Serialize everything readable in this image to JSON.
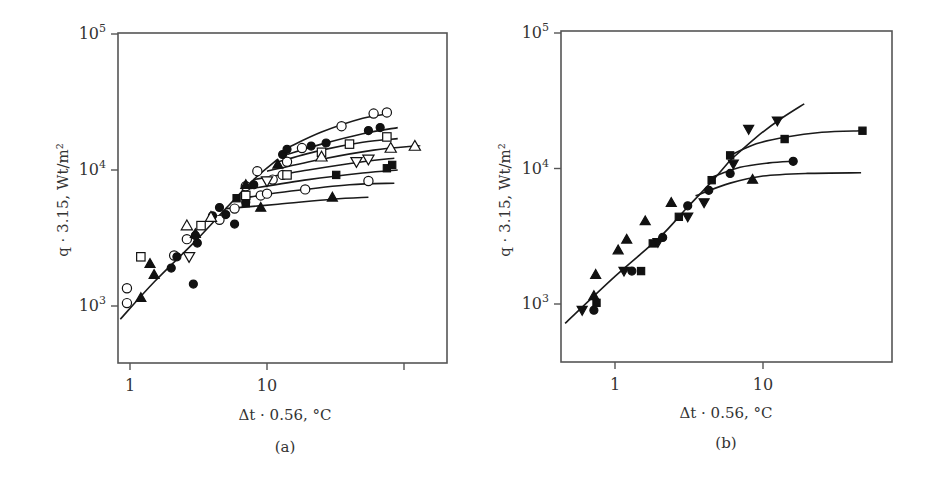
{
  "chart_data": [
    {
      "type": "scatter",
      "panel_label": "(a)",
      "xlabel": "Δt · 0.56, °C",
      "ylabel": "q · 3.15, Wt/m²",
      "xscale": "log",
      "yscale": "log",
      "xlim": [
        0.85,
        230
      ],
      "ylim": [
        450,
        100000
      ],
      "xticks": [
        {
          "v": 1,
          "label": "1"
        },
        {
          "v": 10,
          "label": "10"
        },
        {
          "v": 100,
          "label": ""
        }
      ],
      "yticks": [
        {
          "v": 1000,
          "label": "10",
          "sup": "3"
        },
        {
          "v": 10000,
          "label": "10",
          "sup": "4"
        },
        {
          "v": 100000,
          "label": "10",
          "sup": "5"
        }
      ],
      "grid": false,
      "lines": [
        {
          "name": "common",
          "points": [
            [
              0.85,
              800
            ],
            [
              1.5,
              1500
            ],
            [
              3,
              3000
            ],
            [
              5,
              5200
            ],
            [
              8,
              8500
            ],
            [
              12,
              12000
            ]
          ]
        },
        {
          "name": "open-circle-small",
          "points": [
            [
              14,
              14500
            ],
            [
              25,
              19000
            ],
            [
              50,
              24000
            ],
            [
              80,
              26000
            ]
          ]
        },
        {
          "name": "filled-circle",
          "points": [
            [
              14,
              13000
            ],
            [
              25,
              15500
            ],
            [
              50,
              18500
            ],
            [
              90,
              20500
            ]
          ]
        },
        {
          "name": "open-square",
          "points": [
            [
              12,
              11500
            ],
            [
              25,
              14000
            ],
            [
              50,
              16000
            ],
            [
              90,
              17000
            ]
          ]
        },
        {
          "name": "open-triangle",
          "points": [
            [
              10,
              9800
            ],
            [
              25,
              12000
            ],
            [
              60,
              14000
            ],
            [
              120,
              15000
            ],
            [
              130,
              15000
            ]
          ]
        },
        {
          "name": "open-triangle-down",
          "points": [
            [
              8,
              8500
            ],
            [
              20,
              10000
            ],
            [
              50,
              11500
            ],
            [
              85,
              12200
            ]
          ]
        },
        {
          "name": "filled-square",
          "points": [
            [
              7,
              7200
            ],
            [
              20,
              8500
            ],
            [
              50,
              9500
            ],
            [
              90,
              10000
            ]
          ]
        },
        {
          "name": "open-circle-large",
          "points": [
            [
              6.5,
              6200
            ],
            [
              15,
              7000
            ],
            [
              40,
              7800
            ],
            [
              85,
              8000
            ]
          ]
        },
        {
          "name": "filled-triangle",
          "points": [
            [
              5,
              5200
            ],
            [
              12,
              5600
            ],
            [
              30,
              6100
            ],
            [
              55,
              6300
            ]
          ]
        }
      ],
      "series": [
        {
          "name": "open-circle",
          "marker": "circle",
          "filled": false,
          "points": [
            [
              0.95,
              1350
            ],
            [
              0.95,
              1050
            ],
            [
              2.1,
              2350
            ],
            [
              2.6,
              3100
            ],
            [
              4.5,
              4300
            ],
            [
              5.8,
              5200
            ],
            [
              7,
              7600
            ],
            [
              8.5,
              9800
            ],
            [
              9,
              6500
            ],
            [
              10,
              6700
            ],
            [
              11,
              8500
            ],
            [
              13,
              9200
            ],
            [
              14,
              11500
            ],
            [
              18,
              14500
            ],
            [
              19,
              7200
            ],
            [
              35,
              21000
            ],
            [
              60,
              26000
            ],
            [
              75,
              26500
            ],
            [
              55,
              8300
            ]
          ]
        },
        {
          "name": "filled-circle",
          "marker": "circle",
          "filled": true,
          "points": [
            [
              2,
              1900
            ],
            [
              2.2,
              2300
            ],
            [
              2.9,
              1450
            ],
            [
              3.1,
              2900
            ],
            [
              3,
              3300
            ],
            [
              4,
              4600
            ],
            [
              4.5,
              5300
            ],
            [
              5,
              4700
            ],
            [
              5.8,
              4000
            ],
            [
              7,
              5800
            ],
            [
              8,
              7800
            ],
            [
              13,
              13000
            ],
            [
              14,
              14200
            ],
            [
              21,
              15000
            ],
            [
              27,
              15800
            ],
            [
              55,
              19500
            ],
            [
              67,
              20500
            ]
          ]
        },
        {
          "name": "open-square",
          "marker": "square",
          "filled": false,
          "points": [
            [
              1.2,
              2300
            ],
            [
              3.3,
              3900
            ],
            [
              7,
              6500
            ],
            [
              14,
              9200
            ],
            [
              25,
              13500
            ],
            [
              40,
              15500
            ],
            [
              75,
              17500
            ]
          ]
        },
        {
          "name": "filled-square",
          "marker": "square",
          "filled": true,
          "points": [
            [
              6,
              6200
            ],
            [
              7,
              5700
            ],
            [
              32,
              9200
            ],
            [
              75,
              10300
            ],
            [
              82,
              10900
            ]
          ]
        },
        {
          "name": "open-triangle",
          "marker": "triangle",
          "filled": false,
          "points": [
            [
              2.6,
              3900
            ],
            [
              3.9,
              4500
            ],
            [
              25,
              12500
            ],
            [
              80,
              14500
            ],
            [
              120,
              15000
            ]
          ]
        },
        {
          "name": "filled-triangle",
          "marker": "triangle",
          "filled": true,
          "points": [
            [
              1.2,
              1150
            ],
            [
              1.4,
              2050
            ],
            [
              1.5,
              1700
            ],
            [
              3,
              3400
            ],
            [
              7,
              7800
            ],
            [
              9,
              5300
            ],
            [
              12,
              11000
            ],
            [
              30,
              6300
            ]
          ]
        },
        {
          "name": "open-triangle-down",
          "marker": "triangle-down",
          "filled": false,
          "points": [
            [
              2.7,
              2300
            ],
            [
              10,
              8300
            ],
            [
              45,
              11500
            ],
            [
              55,
              12000
            ]
          ]
        }
      ]
    },
    {
      "type": "scatter",
      "panel_label": "(b)",
      "xlabel": "Δt · 0.56, °C",
      "ylabel": "q · 3.15, Wt/m²",
      "xscale": "log",
      "yscale": "log",
      "xlim": [
        0.42,
        90
      ],
      "ylim": [
        450,
        100000
      ],
      "xticks": [
        {
          "v": 1,
          "label": "1"
        },
        {
          "v": 10,
          "label": "10"
        }
      ],
      "yticks": [
        {
          "v": 1000,
          "label": "10",
          "sup": "3"
        },
        {
          "v": 10000,
          "label": "10",
          "sup": "4"
        },
        {
          "v": 100000,
          "label": "10",
          "sup": "5"
        }
      ],
      "grid": false,
      "lines": [
        {
          "name": "common",
          "points": [
            [
              0.46,
              720
            ],
            [
              1,
              1600
            ],
            [
              2,
              3100
            ],
            [
              3,
              5000
            ],
            [
              4.5,
              8000
            ],
            [
              6,
              11500
            ]
          ]
        },
        {
          "name": "filled-triangle-down",
          "points": [
            [
              6,
              11500
            ],
            [
              9,
              17000
            ],
            [
              13,
              23000
            ],
            [
              19,
              30000
            ]
          ]
        },
        {
          "name": "filled-square",
          "points": [
            [
              6,
              12500
            ],
            [
              9,
              15200
            ],
            [
              14,
              17000
            ],
            [
              25,
              18500
            ],
            [
              46,
              19000
            ]
          ]
        },
        {
          "name": "filled-circle",
          "points": [
            [
              4.5,
              8600
            ],
            [
              7,
              10200
            ],
            [
              11,
              11000
            ],
            [
              16,
              11300
            ]
          ]
        },
        {
          "name": "filled-triangle",
          "points": [
            [
              3.5,
              6300
            ],
            [
              6,
              7800
            ],
            [
              10,
              8800
            ],
            [
              20,
              9200
            ],
            [
              46,
              9300
            ]
          ]
        }
      ],
      "series": [
        {
          "name": "filled-triangle",
          "marker": "triangle",
          "filled": true,
          "points": [
            [
              0.72,
              1150
            ],
            [
              0.74,
              1650
            ],
            [
              1.05,
              2500
            ],
            [
              1.2,
              3000
            ],
            [
              1.6,
              4100
            ],
            [
              2.4,
              5600
            ],
            [
              8.5,
              8300
            ]
          ]
        },
        {
          "name": "filled-circle",
          "marker": "circle",
          "filled": true,
          "points": [
            [
              0.72,
              900
            ],
            [
              1.3,
              1750
            ],
            [
              2.1,
              3100
            ],
            [
              3.1,
              5300
            ],
            [
              4.3,
              6900
            ],
            [
              6,
              9200
            ],
            [
              16,
              11300
            ]
          ]
        },
        {
          "name": "filled-square",
          "marker": "square",
          "filled": true,
          "points": [
            [
              0.75,
              1020
            ],
            [
              1.5,
              1750
            ],
            [
              1.8,
              2800
            ],
            [
              2.7,
              4400
            ],
            [
              4.5,
              8200
            ],
            [
              6,
              12500
            ],
            [
              14,
              16500
            ],
            [
              47,
              19000
            ]
          ]
        },
        {
          "name": "filled-triangle-down",
          "marker": "triangle-down",
          "filled": true,
          "points": [
            [
              0.6,
              900
            ],
            [
              1.15,
              1750
            ],
            [
              1.95,
              2850
            ],
            [
              3.1,
              4400
            ],
            [
              4,
              5600
            ],
            [
              6.3,
              10800
            ],
            [
              8,
              19500
            ],
            [
              12.5,
              22500
            ]
          ]
        }
      ]
    }
  ],
  "panels": {
    "a": {
      "label": "(a)",
      "xlabel": "Δt · 0.56, °C",
      "ylabel": "q · 3.15, Wt/m²"
    },
    "b": {
      "label": "(b)",
      "xlabel": "Δt · 0.56, °C",
      "ylabel": "q · 3.15, Wt/m²"
    }
  }
}
